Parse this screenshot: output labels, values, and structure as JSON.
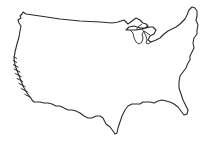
{
  "map": {
    "subject": "Contiguous United States outline",
    "highlighted_region": "West coast (California) shown with diagonal hatching",
    "colors": {
      "stroke": "#2b2b2b",
      "background": "#ffffff",
      "hatch": "#2b2b2b"
    }
  }
}
